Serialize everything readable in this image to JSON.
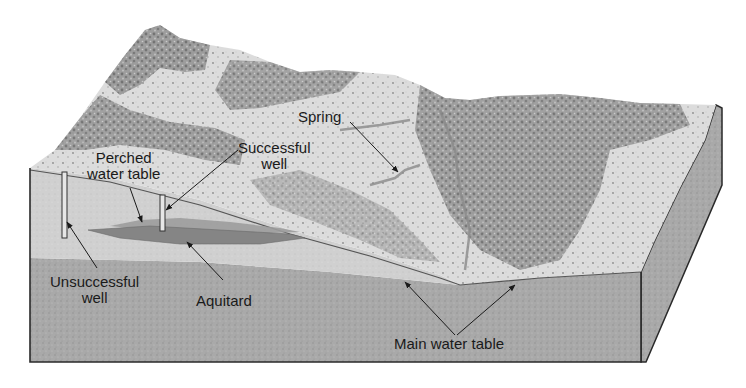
{
  "diagram": {
    "type": "block-diagram",
    "colors": {
      "background": "#ffffff",
      "upper_zone": "#cfcfcf",
      "saturated_zone": "#a9a9a9",
      "aquitard": "#8a8a8a",
      "perched_water": "#9c9c9c",
      "terrain_light": "#dedede",
      "terrain_dark": "#7d7d7d",
      "side_face": "#9a9a9a",
      "outline": "#2a2a2a",
      "label_text": "#1a1a1a"
    },
    "labels": {
      "spring": {
        "lines": [
          "Spring"
        ]
      },
      "successful_well": {
        "lines": [
          "Successful",
          "well"
        ]
      },
      "perched_water_table": {
        "lines": [
          "Perched",
          "water table"
        ]
      },
      "unsuccessful_well": {
        "lines": [
          "Unsuccessful",
          "well"
        ]
      },
      "aquitard": {
        "lines": [
          "Aquitard"
        ]
      },
      "main_water_table": {
        "lines": [
          "Main water table"
        ]
      }
    }
  }
}
